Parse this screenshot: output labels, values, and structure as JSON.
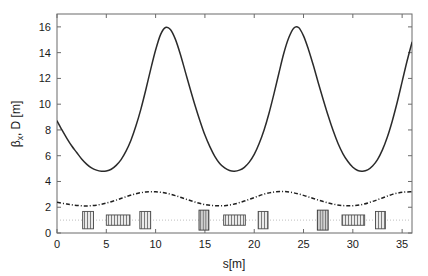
{
  "figure": {
    "title": "",
    "background_color": "#ffffff",
    "axis_color": "#6b6b6b"
  },
  "chart_data": {
    "type": "line",
    "title": "",
    "xlabel": "s[m]",
    "ylabel": "βx, D [m]",
    "ylabel_parts": {
      "beta": "β",
      "subscript": "x",
      "rest": ", D [m]"
    },
    "xlim": [
      0,
      36
    ],
    "ylim": [
      0,
      17
    ],
    "xticks": [
      0,
      5,
      10,
      15,
      20,
      25,
      30,
      35
    ],
    "xticklabels": [
      "0",
      "5",
      "10",
      "15",
      "20",
      "25",
      "30",
      "35"
    ],
    "yticks": [
      0,
      2,
      4,
      6,
      8,
      10,
      12,
      14,
      16
    ],
    "yticklabels": [
      "0",
      "2",
      "4",
      "6",
      "8",
      "10",
      "12",
      "14",
      "16"
    ],
    "grid": false,
    "legend": null,
    "series": [
      {
        "name": "beta_x",
        "label": "βx",
        "style": "solid",
        "color": "#2b2b2b",
        "x": [
          0,
          0.5,
          1,
          1.5,
          2,
          2.5,
          3,
          3.5,
          4,
          4.5,
          5,
          5.5,
          6,
          6.5,
          7,
          7.5,
          8,
          8.5,
          9,
          9.5,
          10,
          10.5,
          11,
          11.5,
          12,
          12.5,
          13,
          13.5,
          14,
          14.5,
          15,
          15.5,
          16,
          16.5,
          17,
          17.5,
          18,
          18.5,
          19,
          19.5,
          20,
          20.5,
          21,
          21.5,
          22,
          22.5,
          23,
          23.5,
          24,
          24.5,
          25,
          25.5,
          26,
          26.5,
          27,
          27.5,
          28,
          28.5,
          29,
          29.5,
          30,
          30.5,
          31,
          31.5,
          32,
          32.5,
          33,
          33.5,
          34,
          34.5,
          35,
          35.5,
          36
        ],
        "y": [
          8.7,
          8.0,
          7.35,
          6.75,
          6.25,
          5.75,
          5.35,
          5.05,
          4.88,
          4.8,
          4.82,
          4.95,
          5.25,
          5.7,
          6.35,
          7.2,
          8.3,
          9.6,
          11.1,
          12.7,
          14.2,
          15.4,
          15.95,
          15.8,
          15.05,
          13.9,
          12.55,
          11.2,
          9.9,
          8.7,
          7.6,
          6.7,
          5.95,
          5.4,
          5.05,
          4.85,
          4.8,
          4.88,
          5.1,
          5.5,
          6.1,
          6.95,
          8.0,
          9.3,
          10.8,
          12.4,
          13.95,
          15.15,
          15.9,
          15.95,
          15.3,
          14.25,
          13.0,
          11.65,
          10.35,
          9.1,
          7.95,
          6.95,
          6.15,
          5.55,
          5.1,
          4.85,
          4.8,
          4.9,
          5.2,
          5.7,
          6.45,
          7.45,
          8.7,
          10.15,
          11.75,
          13.35,
          14.8
        ]
      },
      {
        "name": "dispersion",
        "label": "D",
        "style": "dash-dot",
        "color": "#1f1f1f",
        "x": [
          0,
          1,
          2,
          3,
          4,
          5,
          6,
          7,
          8,
          9,
          10,
          11,
          12,
          13,
          14,
          15,
          16,
          17,
          18,
          19,
          20,
          21,
          22,
          23,
          24,
          25,
          26,
          27,
          28,
          29,
          30,
          31,
          32,
          33,
          34,
          35,
          36
        ],
        "y": [
          2.38,
          2.25,
          2.14,
          2.1,
          2.16,
          2.32,
          2.55,
          2.82,
          3.05,
          3.18,
          3.2,
          3.1,
          2.9,
          2.65,
          2.4,
          2.2,
          2.12,
          2.12,
          2.25,
          2.48,
          2.75,
          3.02,
          3.18,
          3.22,
          3.12,
          2.92,
          2.68,
          2.44,
          2.24,
          2.13,
          2.12,
          2.22,
          2.45,
          2.72,
          3.0,
          3.16,
          3.2
        ]
      }
    ],
    "reference_line": {
      "name": "beam-axis",
      "y": 1.0,
      "style": "dotted",
      "color": "#b9b9b9"
    },
    "lattice_elements": [
      {
        "name": "quadrupole",
        "s_start": 2.6,
        "s_end": 3.7,
        "height": 1.35,
        "center_y": 1.0,
        "shade": "light"
      },
      {
        "name": "dipole",
        "s_start": 5.0,
        "s_end": 7.4,
        "height": 0.8,
        "center_y": 1.0,
        "shade": "light"
      },
      {
        "name": "quadrupole",
        "s_start": 8.4,
        "s_end": 9.5,
        "height": 1.35,
        "center_y": 1.0,
        "shade": "light"
      },
      {
        "name": "quadrupole",
        "s_start": 14.4,
        "s_end": 15.4,
        "height": 1.55,
        "center_y": 1.0,
        "shade": "dark"
      },
      {
        "name": "dipole",
        "s_start": 16.9,
        "s_end": 19.1,
        "height": 0.8,
        "center_y": 1.0,
        "shade": "light"
      },
      {
        "name": "quadrupole",
        "s_start": 20.4,
        "s_end": 21.4,
        "height": 1.35,
        "center_y": 1.0,
        "shade": "light"
      },
      {
        "name": "quadrupole",
        "s_start": 26.4,
        "s_end": 27.5,
        "height": 1.55,
        "center_y": 1.0,
        "shade": "dark"
      },
      {
        "name": "dipole",
        "s_start": 28.9,
        "s_end": 31.2,
        "height": 0.8,
        "center_y": 1.0,
        "shade": "light"
      },
      {
        "name": "quadrupole",
        "s_start": 32.3,
        "s_end": 33.3,
        "height": 1.35,
        "center_y": 1.0,
        "shade": "light"
      }
    ]
  }
}
